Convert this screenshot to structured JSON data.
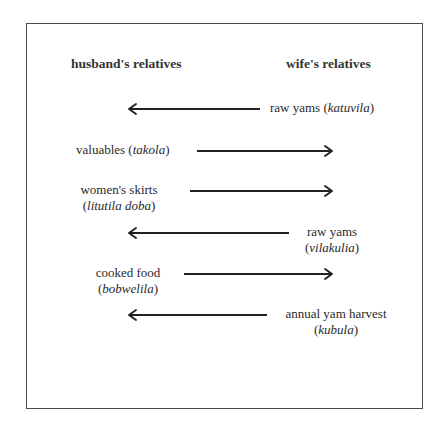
{
  "diagram": {
    "type": "exchange-flow",
    "left_party": "husband's relatives",
    "right_party": "wife's relatives",
    "exchanges": [
      {
        "item": "raw yams",
        "term": "katuvila",
        "direction": "right-to-left",
        "label_side": "right"
      },
      {
        "item": "valuables",
        "term": "takola",
        "direction": "left-to-right",
        "label_side": "left"
      },
      {
        "item": "women's skirts",
        "term": "lititila doba",
        "direction": "left-to-right",
        "label_side": "left"
      },
      {
        "item": "raw yams",
        "term": "vilakulia",
        "direction": "right-to-left",
        "label_side": "right"
      },
      {
        "item": "cooked food",
        "term": "bobwelila",
        "direction": "left-to-right",
        "label_side": "left"
      },
      {
        "item": "annual yam harvest",
        "term": "kubula",
        "direction": "right-to-left",
        "label_side": "right"
      }
    ]
  },
  "headers": {
    "left": "husband's relatives",
    "right": "wife's relatives"
  },
  "rows": [
    {
      "item": "raw yams (",
      "term": "katuvila",
      "close": ")"
    },
    {
      "item": "valuables (",
      "term": "takola",
      "close": ")"
    },
    {
      "item": "women's skirts",
      "open": "(",
      "term": "litutila doba",
      "close": ")"
    },
    {
      "item": "raw yams",
      "open": "(",
      "term": "vilakulia",
      "close": ")"
    },
    {
      "item": "cooked food",
      "open": "(",
      "term": "bobwelila",
      "close": ")"
    },
    {
      "item": "annual yam harvest",
      "open": "(",
      "term": "kubula",
      "close": ")"
    }
  ],
  "colors": {
    "text": "#2a2a2a",
    "arrow": "#222222",
    "frame": "#4a4a4a",
    "background": "#ffffff"
  }
}
